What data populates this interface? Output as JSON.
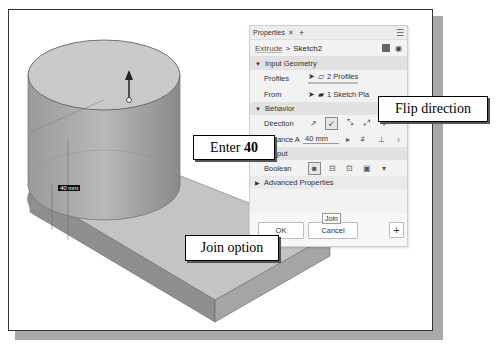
{
  "panel": {
    "tab_label": "Properties",
    "tab_close": "✕",
    "tab_add": "+",
    "menu_icon": "☰",
    "breadcrumb": {
      "feature": "Extrude",
      "separator": ">",
      "sketch": "Sketch2"
    },
    "sections": {
      "input_geometry": {
        "title": "Input Geometry",
        "profiles_label": "Profiles",
        "profiles_value": "2 Profiles",
        "from_label": "From",
        "from_value": "1 Sketch Pla"
      },
      "behavior": {
        "title": "Behavior",
        "direction_label": "Direction",
        "distance_label": "Distance A",
        "distance_value": "40 mm"
      },
      "output": {
        "title": "Output",
        "boolean_label": "Boolean",
        "tooltip": "Join"
      },
      "advanced": {
        "title": "Advanced Properties"
      }
    },
    "buttons": {
      "ok": "OK",
      "cancel": "Cancel",
      "add": "+"
    }
  },
  "viewport": {
    "dimension_label": "40 mm"
  },
  "callouts": {
    "flip": "Flip direction",
    "enter_prefix": "Enter ",
    "enter_value": "40",
    "join": "Join option"
  }
}
